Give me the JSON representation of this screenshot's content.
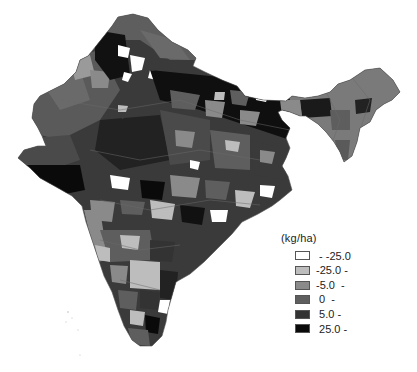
{
  "legend": {
    "unit": "(kg/ha)",
    "items": [
      {
        "label": " - -25.0",
        "color": "#ffffff"
      },
      {
        "label": "-25.0 -",
        "color": "#bdbdbd"
      },
      {
        "label": "-5.0  -",
        "color": "#8a8a8a"
      },
      {
        "label": " 0  -",
        "color": "#5e5e5e"
      },
      {
        "label": " 5.0 -",
        "color": "#333333"
      },
      {
        "label": " 25.0 -",
        "color": "#0a0a0a"
      }
    ]
  },
  "map": {
    "region": "India",
    "type": "choropleth by district",
    "palette": {
      "lt_-25": "#ffffff",
      "-25_to_-5": "#bdbdbd",
      "-5_to_0": "#8a8a8a",
      "0_to_5": "#5e5e5e",
      "5_to_25": "#333333",
      "gt_25": "#0a0a0a"
    }
  }
}
